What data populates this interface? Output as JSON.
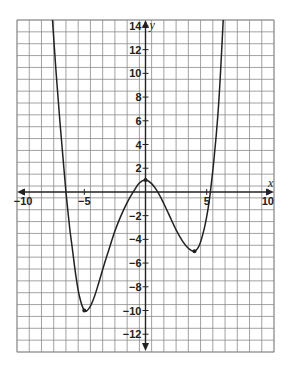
{
  "chart_data": {
    "type": "line",
    "title": "",
    "xlabel": "x",
    "ylabel": "y",
    "xlim": [
      -10.5,
      10.5
    ],
    "ylim": [
      -13.5,
      14.5
    ],
    "grid": true,
    "grid_step": 1,
    "x_ticks": [
      -10,
      -5,
      5,
      10
    ],
    "x_tick_labels": [
      "−10",
      "−5",
      "5",
      "10"
    ],
    "y_ticks": [
      14,
      12,
      10,
      8,
      6,
      4,
      2,
      -2,
      -4,
      -6,
      -8,
      -10,
      -12
    ],
    "y_tick_labels": [
      "14",
      "12",
      "10",
      "8",
      "6",
      "4",
      "2",
      "−2",
      "−4",
      "−6",
      "−8",
      "−10",
      "−12"
    ],
    "series": [
      {
        "name": "f(x)",
        "color": "#222222",
        "points": [
          [
            -7.6,
            14.5
          ],
          [
            -7.3,
            10
          ],
          [
            -7.0,
            6
          ],
          [
            -6.75,
            3
          ],
          [
            -6.5,
            0
          ],
          [
            -6.2,
            -3
          ],
          [
            -6.0,
            -4.6
          ],
          [
            -5.7,
            -7
          ],
          [
            -5.4,
            -8.8
          ],
          [
            -5.0,
            -10
          ],
          [
            -4.6,
            -9.8
          ],
          [
            -4.2,
            -8.9
          ],
          [
            -3.8,
            -7.6
          ],
          [
            -3.4,
            -6.2
          ],
          [
            -3.0,
            -4.9
          ],
          [
            -2.5,
            -3.3
          ],
          [
            -2.0,
            -2.0
          ],
          [
            -1.5,
            -0.9
          ],
          [
            -1.0,
            0
          ],
          [
            -0.5,
            0.75
          ],
          [
            0,
            1
          ],
          [
            0.5,
            0.7
          ],
          [
            1.0,
            0
          ],
          [
            1.5,
            -1.0
          ],
          [
            2.0,
            -2.1
          ],
          [
            2.5,
            -3.2
          ],
          [
            3.0,
            -4.1
          ],
          [
            3.5,
            -4.75
          ],
          [
            4.0,
            -5
          ],
          [
            4.4,
            -4.5
          ],
          [
            4.8,
            -3.1
          ],
          [
            5.1,
            -1.5
          ],
          [
            5.3,
            0
          ],
          [
            5.6,
            2.8
          ],
          [
            5.9,
            6.3
          ],
          [
            6.1,
            9.5
          ],
          [
            6.35,
            14.5
          ]
        ],
        "marked_points": [
          [
            -5,
            -10
          ],
          [
            4,
            -5
          ],
          [
            0,
            1
          ]
        ]
      }
    ],
    "annotations": []
  },
  "axes": {
    "x_name": "x",
    "y_name": "y"
  }
}
